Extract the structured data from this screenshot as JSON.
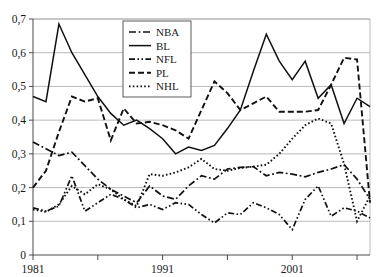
{
  "chart_data": {
    "type": "line",
    "title": "",
    "subtitle": "",
    "xlabel": "",
    "ylabel": "",
    "xlim": [
      1981,
      2007
    ],
    "ylim": [
      0,
      0.7
    ],
    "grid": true,
    "legend_position": "top-center",
    "decimal_separator": ",",
    "x": [
      1981,
      1982,
      1983,
      1984,
      1985,
      1986,
      1987,
      1988,
      1989,
      1990,
      1991,
      1992,
      1993,
      1994,
      1995,
      1996,
      1997,
      1998,
      1999,
      2000,
      2001,
      2002,
      2003,
      2004,
      2005,
      2006,
      2007
    ],
    "y_ticks": [
      0,
      0.1,
      0.2,
      0.3,
      0.4,
      0.5,
      0.6,
      0.7
    ],
    "y_tick_labels": [
      "0",
      "0,1",
      "0,2",
      "0,3",
      "0,4",
      "0,5",
      "0,6",
      "0,7"
    ],
    "x_ticks": [
      1981,
      1986,
      1991,
      1996,
      2001,
      2006
    ],
    "x_tick_labels": [
      "1981",
      "",
      "1991",
      "",
      "2001",
      ""
    ],
    "x_labeled_ticks": [
      {
        "value": 1981,
        "label": "1981"
      },
      {
        "value": 1991,
        "label": "1991"
      },
      {
        "value": 2001,
        "label": "2001"
      }
    ],
    "series": [
      {
        "name": "NBA",
        "dash": "dash-dot",
        "values": [
          0.335,
          0.315,
          0.295,
          0.305,
          0.265,
          0.225,
          0.195,
          0.175,
          0.155,
          0.205,
          0.175,
          0.165,
          0.205,
          0.235,
          0.225,
          0.255,
          0.26,
          0.262,
          0.235,
          0.245,
          0.24,
          0.232,
          0.245,
          0.255,
          0.268,
          0.225,
          0.165
        ]
      },
      {
        "name": "BL",
        "dash": "solid",
        "values": [
          0.47,
          0.455,
          0.685,
          0.6,
          0.535,
          0.47,
          0.42,
          0.385,
          0.4,
          0.375,
          0.345,
          0.3,
          0.32,
          0.31,
          0.325,
          0.375,
          0.43,
          0.545,
          0.655,
          0.575,
          0.52,
          0.575,
          0.465,
          0.505,
          0.39,
          0.465,
          0.44
        ]
      },
      {
        "name": "NFL",
        "dash": "dash-dot-dot",
        "values": [
          0.14,
          0.13,
          0.145,
          0.235,
          0.13,
          0.155,
          0.18,
          0.165,
          0.14,
          0.15,
          0.135,
          0.155,
          0.15,
          0.12,
          0.095,
          0.125,
          0.12,
          0.155,
          0.14,
          0.12,
          0.075,
          0.165,
          0.205,
          0.115,
          0.14,
          0.13,
          0.11
        ]
      },
      {
        "name": "PL",
        "dash": "dashed",
        "values": [
          0.2,
          0.25,
          0.365,
          0.47,
          0.455,
          0.465,
          0.34,
          0.435,
          0.39,
          0.395,
          0.385,
          0.37,
          0.345,
          0.43,
          0.515,
          0.48,
          0.43,
          0.45,
          0.47,
          0.425,
          0.425,
          0.425,
          0.43,
          0.505,
          0.585,
          0.58,
          0.155
        ]
      },
      {
        "name": "NHL",
        "dash": "dotted",
        "values": [
          0.135,
          0.128,
          0.15,
          0.205,
          0.18,
          0.21,
          0.195,
          0.165,
          0.145,
          0.24,
          0.235,
          0.245,
          0.26,
          0.285,
          0.255,
          0.25,
          0.258,
          0.262,
          0.268,
          0.3,
          0.345,
          0.385,
          0.405,
          0.39,
          0.27,
          0.1,
          0.175
        ]
      }
    ]
  },
  "legend": {
    "entries": [
      {
        "label": "NBA"
      },
      {
        "label": "BL"
      },
      {
        "label": "NFL"
      },
      {
        "label": "PL"
      },
      {
        "label": "NHL"
      }
    ]
  },
  "colors": {
    "series_stroke": "#111111",
    "gridline": "#a8a8a8",
    "axis": "#4a4a4a",
    "background": "#ffffff",
    "text": "#1a1a1a"
  }
}
